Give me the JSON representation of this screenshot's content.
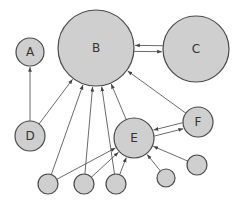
{
  "diagram": {
    "type": "directed-graph",
    "colors": {
      "node_fill": "#cfcfcf",
      "node_stroke": "#4a4a4a",
      "edge": "#444444",
      "label": "#333333",
      "background": "#ffffff"
    },
    "nodes": [
      {
        "id": "A",
        "label": "A",
        "cx": 30,
        "cy": 52,
        "r": 14
      },
      {
        "id": "B",
        "label": "B",
        "cx": 96,
        "cy": 48,
        "r": 38
      },
      {
        "id": "C",
        "label": "C",
        "cx": 196,
        "cy": 49,
        "r": 33
      },
      {
        "id": "D",
        "label": "D",
        "cx": 30,
        "cy": 136,
        "r": 15
      },
      {
        "id": "E",
        "label": "E",
        "cx": 134,
        "cy": 138,
        "r": 20
      },
      {
        "id": "F",
        "label": "F",
        "cx": 198,
        "cy": 122,
        "r": 15
      },
      {
        "id": "s1",
        "label": "",
        "cx": 48,
        "cy": 184,
        "r": 10
      },
      {
        "id": "s2",
        "label": "",
        "cx": 84,
        "cy": 184,
        "r": 10
      },
      {
        "id": "s3",
        "label": "",
        "cx": 116,
        "cy": 184,
        "r": 10
      },
      {
        "id": "s4",
        "label": "",
        "cx": 166,
        "cy": 178,
        "r": 9
      },
      {
        "id": "s5",
        "label": "",
        "cx": 197,
        "cy": 165,
        "r": 10
      }
    ],
    "edges": [
      {
        "from": "D",
        "to": "A"
      },
      {
        "from": "D",
        "to": "B"
      },
      {
        "from": "s1",
        "to": "B"
      },
      {
        "from": "s1",
        "to": "E"
      },
      {
        "from": "s2",
        "to": "B"
      },
      {
        "from": "s2",
        "to": "E"
      },
      {
        "from": "s3",
        "to": "B"
      },
      {
        "from": "s3",
        "to": "E"
      },
      {
        "from": "E",
        "to": "B"
      },
      {
        "from": "F",
        "to": "B"
      },
      {
        "from": "E",
        "to": "F",
        "offset": 3
      },
      {
        "from": "F",
        "to": "E",
        "offset": 3
      },
      {
        "from": "B",
        "to": "C",
        "offset": 3
      },
      {
        "from": "C",
        "to": "B",
        "offset": 3
      },
      {
        "from": "s4",
        "to": "E"
      },
      {
        "from": "s5",
        "to": "E"
      }
    ]
  }
}
